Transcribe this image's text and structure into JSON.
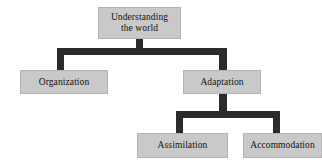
{
  "diagram": {
    "type": "hierarchy-tree",
    "orientation": "top-down",
    "colors": {
      "node_fill": "#c9c9c9",
      "node_border": "#b2b2b2",
      "connector": "#2b2b2b",
      "background": "#ffffff",
      "text": "#121212"
    },
    "nodes": {
      "root": {
        "label": "Understanding\nthe world",
        "level": 0
      },
      "organization": {
        "label": "Organization",
        "level": 1
      },
      "adaptation": {
        "label": "Adaptation",
        "level": 1
      },
      "assimilation": {
        "label": "Assimilation",
        "level": 2
      },
      "accommodation": {
        "label": "Accommodation",
        "level": 2
      }
    },
    "edges": [
      {
        "from": "root",
        "to": "organization"
      },
      {
        "from": "root",
        "to": "adaptation"
      },
      {
        "from": "adaptation",
        "to": "assimilation"
      },
      {
        "from": "adaptation",
        "to": "accommodation"
      }
    ]
  }
}
